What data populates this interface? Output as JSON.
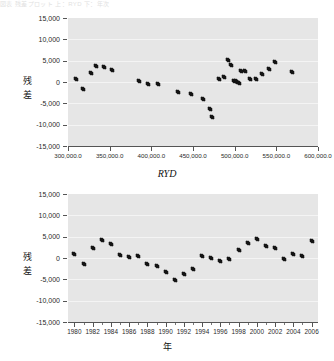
{
  "header_strip_text": "図表  残差プロット  上：RYD  下：年次",
  "charts": [
    {
      "id": "residual-vs-ryd",
      "type": "scatter",
      "title": "",
      "xlabel": "RYD",
      "ylabel_chars": [
        "残",
        "差"
      ],
      "ylabel": "残差",
      "ylim": [
        -15000,
        15000
      ],
      "yticks": [
        15000,
        10000,
        5000,
        0,
        -5000,
        -10000,
        -15000
      ],
      "yticklabels": [
        "15,000",
        "10,000",
        "5,000",
        "0",
        "-5,000",
        "-10,000",
        "-15,000"
      ],
      "xlim": [
        300000,
        600000
      ],
      "xticks": [
        300000,
        350000,
        400000,
        450000,
        500000,
        550000,
        600000
      ],
      "xticklabels": [
        "300,000.0",
        "350,000.0",
        "400,000.0",
        "450,000.0",
        "500,000.0",
        "550,000.0",
        "600,000.0"
      ],
      "grid": true,
      "legend": "none",
      "x": [
        310000,
        318000,
        328000,
        334000,
        343000,
        353000,
        385000,
        396000,
        408000,
        432000,
        447000,
        462000,
        470000,
        473000,
        481000,
        487000,
        492000,
        496000,
        499000,
        501000,
        503000,
        505000,
        508000,
        512000,
        518000,
        525000,
        533000,
        541000,
        548000,
        569000
      ],
      "y": [
        700,
        -1700,
        2200,
        3700,
        3600,
        2900,
        200,
        -500,
        -400,
        -2300,
        -2900,
        -3900,
        -6400,
        -8200,
        700,
        1100,
        5200,
        3900,
        300,
        200,
        -100,
        -200,
        2600,
        2500,
        700,
        600,
        1800,
        3000,
        4800,
        2400
      ]
    },
    {
      "id": "residual-vs-year",
      "type": "scatter",
      "title": "",
      "xlabel": "年",
      "ylabel_chars": [
        "残",
        "差"
      ],
      "ylabel": "残差",
      "ylim": [
        -15000,
        15000
      ],
      "yticks": [
        15000,
        10000,
        5000,
        0,
        -5000,
        -10000,
        -15000
      ],
      "yticklabels": [
        "15,000",
        "10,000",
        "5,000",
        "0",
        "-5,000",
        "-10,000",
        "-15,000"
      ],
      "xlim": [
        1979.3,
        2006.7
      ],
      "xticks": [
        1980,
        1982,
        1984,
        1986,
        1988,
        1990,
        1992,
        1994,
        1996,
        1998,
        2000,
        2002,
        2004,
        2006
      ],
      "xticklabels": [
        "1980",
        "1982",
        "1984",
        "1986",
        "1988",
        "1990",
        "1992",
        "1994",
        "1996",
        "1998",
        "2000",
        "2002",
        "2004",
        "2006"
      ],
      "xminorticks": [
        1980,
        1981,
        1982,
        1983,
        1984,
        1985,
        1986,
        1987,
        1988,
        1989,
        1990,
        1991,
        1992,
        1993,
        1994,
        1995,
        1996,
        1997,
        1998,
        1999,
        2000,
        2001,
        2002,
        2003,
        2004,
        2005,
        2006
      ],
      "grid": true,
      "legend": "none",
      "x": [
        1980,
        1981,
        1982,
        1983,
        1984,
        1985,
        1986,
        1987,
        1988,
        1989,
        1990,
        1991,
        1992,
        1993,
        1994,
        1995,
        1996,
        1997,
        1998,
        1999,
        2000,
        2001,
        2002,
        2003,
        2004,
        2005,
        2006
      ],
      "y": [
        900,
        -1300,
        2400,
        4200,
        3300,
        700,
        200,
        400,
        -1400,
        -1900,
        -3200,
        -5200,
        -3800,
        -2600,
        500,
        100,
        -700,
        -300,
        1800,
        3400,
        4400,
        2700,
        2300,
        -300,
        900,
        400,
        3900
      ]
    }
  ],
  "colors": {
    "plot_background": "#e6e6e6",
    "gridline": "#f4f4f4",
    "marker": "#141414",
    "axis": "#555555",
    "text": "#1a1a1a"
  }
}
